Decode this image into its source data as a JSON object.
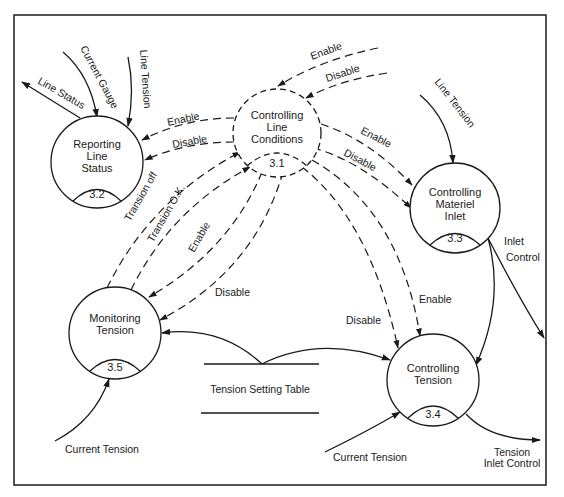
{
  "diagram": {
    "type": "data-flow-diagram",
    "processes": [
      {
        "id": "3.1",
        "lines": [
          "Controlling",
          "Line",
          "Conditions"
        ],
        "style": "dashed"
      },
      {
        "id": "3.2",
        "lines": [
          "Reporting",
          "Line",
          "Status"
        ],
        "style": "solid"
      },
      {
        "id": "3.3",
        "lines": [
          "Controlling",
          "Materiel",
          "Inlet"
        ],
        "style": "solid"
      },
      {
        "id": "3.4",
        "lines": [
          "Controlling",
          "Tension"
        ],
        "style": "solid"
      },
      {
        "id": "3.5",
        "lines": [
          "Monitoring",
          "Tension"
        ],
        "style": "solid"
      }
    ],
    "data_store": {
      "label": "Tension Setting Table"
    },
    "flows": {
      "line_status": "Line Status",
      "current_gauge": "Current Gauge",
      "line_tension_32": "Line Tension",
      "enable_in_31": "Enable",
      "disable_in_31": "Disable",
      "enable_32": "Enable",
      "disable_32": "Disable",
      "line_tension_33": "Line Tension",
      "enable_33": "Enable",
      "disable_33": "Disable",
      "transion_off": "Transion off",
      "transion_ok": "Transion O.K.",
      "enable_35": "Enable",
      "disable_35": "Disable",
      "disable_34": "Disable",
      "enable_34": "Enable",
      "inlet_control_1": "Inlet",
      "inlet_control_2": "Control",
      "current_tension_35": "Current Tension",
      "current_tension_34": "Current Tension",
      "tension_inlet_control_1": "Tension",
      "tension_inlet_control_2": "Inlet Control"
    }
  }
}
